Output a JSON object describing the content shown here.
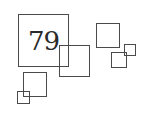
{
  "logo": {
    "number": "79",
    "stroke_color": "#4a4a4a",
    "text_color": "#2a2a2a",
    "background": "#ffffff"
  }
}
